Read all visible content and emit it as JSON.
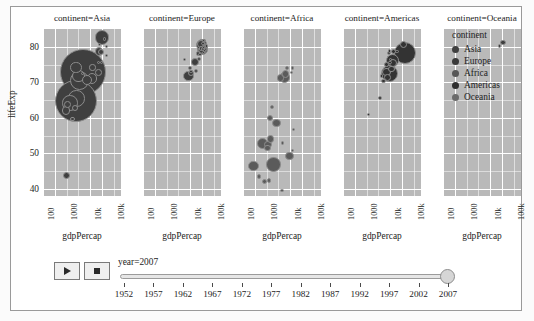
{
  "chart_data": {
    "type": "scatter",
    "title": "",
    "xlabel": "gdpPercap",
    "ylabel": "lifeExp",
    "xscale": "log",
    "xlim": [
      100,
      200000
    ],
    "ylim": [
      38,
      85
    ],
    "grid": true,
    "legend_position": "right",
    "legend_title": "continent",
    "size_by": "pop",
    "color_by": "continent",
    "animation_frame": "year",
    "current_frame": "year=2007",
    "xticks": [
      "100",
      "1000",
      "10k",
      "100k"
    ],
    "yticks": [
      "40",
      "50",
      "60",
      "70",
      "80"
    ],
    "facet_col": "continent",
    "facets": [
      {
        "title": "continent=Asia",
        "points": [
          {
            "country": "Japan",
            "gdpPercap": 31656,
            "lifeExp": 82.6,
            "pop": 127467972
          },
          {
            "country": "Hong Kong",
            "gdpPercap": 39725,
            "lifeExp": 82.2,
            "pop": 6980412
          },
          {
            "country": "Singapore",
            "gdpPercap": 47143,
            "lifeExp": 80.0,
            "pop": 4553009
          },
          {
            "country": "Israel",
            "gdpPercap": 25523,
            "lifeExp": 80.7,
            "pop": 6426679
          },
          {
            "country": "Korea Rep.",
            "gdpPercap": 23348,
            "lifeExp": 78.6,
            "pop": 49044790
          },
          {
            "country": "Kuwait",
            "gdpPercap": 47307,
            "lifeExp": 77.6,
            "pop": 2505559
          },
          {
            "country": "Taiwan",
            "gdpPercap": 28718,
            "lifeExp": 78.4,
            "pop": 23174294
          },
          {
            "country": "Bahrain",
            "gdpPercap": 29796,
            "lifeExp": 75.6,
            "pop": 708573
          },
          {
            "country": "Oman",
            "gdpPercap": 22316,
            "lifeExp": 75.6,
            "pop": 3204897
          },
          {
            "country": "Saudi Arabia",
            "gdpPercap": 21655,
            "lifeExp": 72.8,
            "pop": 27601038
          },
          {
            "country": "China",
            "gdpPercap": 4959,
            "lifeExp": 72.9,
            "pop": 1318683096
          },
          {
            "country": "Malaysia",
            "gdpPercap": 12451,
            "lifeExp": 74.2,
            "pop": 24821286
          },
          {
            "country": "Jordan",
            "gdpPercap": 4519,
            "lifeExp": 72.5,
            "pop": 6053193
          },
          {
            "country": "Iran",
            "gdpPercap": 11606,
            "lifeExp": 71.0,
            "pop": 69453570
          },
          {
            "country": "Thailand",
            "gdpPercap": 7458,
            "lifeExp": 70.6,
            "pop": 65068149
          },
          {
            "country": "Vietnam",
            "gdpPercap": 2441,
            "lifeExp": 74.2,
            "pop": 85262356
          },
          {
            "country": "Philippines",
            "gdpPercap": 3190,
            "lifeExp": 71.7,
            "pop": 91077287
          },
          {
            "country": "Indonesia",
            "gdpPercap": 3540,
            "lifeExp": 70.6,
            "pop": 223547000
          },
          {
            "country": "India",
            "gdpPercap": 2452,
            "lifeExp": 64.7,
            "pop": 1110396331
          },
          {
            "country": "Pakistan",
            "gdpPercap": 2605,
            "lifeExp": 65.5,
            "pop": 169270617
          },
          {
            "country": "Bangladesh",
            "gdpPercap": 1391,
            "lifeExp": 64.1,
            "pop": 150448339
          },
          {
            "country": "Myanmar",
            "gdpPercap": 944,
            "lifeExp": 62.1,
            "pop": 47761980
          },
          {
            "country": "Nepal",
            "gdpPercap": 1091,
            "lifeExp": 63.8,
            "pop": 28901790
          },
          {
            "country": "Cambodia",
            "gdpPercap": 1713,
            "lifeExp": 59.7,
            "pop": 14131858
          },
          {
            "country": "Yemen Rep.",
            "gdpPercap": 2280,
            "lifeExp": 62.7,
            "pop": 22211743
          },
          {
            "country": "Afghanistan",
            "gdpPercap": 975,
            "lifeExp": 43.8,
            "pop": 31889923
          }
        ]
      },
      {
        "title": "continent=Europe",
        "points": [
          {
            "country": "Norway",
            "gdpPercap": 49357,
            "lifeExp": 80.2,
            "pop": 4627926
          },
          {
            "country": "Switzerland",
            "gdpPercap": 37506,
            "lifeExp": 81.7,
            "pop": 7554661
          },
          {
            "country": "Iceland",
            "gdpPercap": 36181,
            "lifeExp": 81.8,
            "pop": 301931
          },
          {
            "country": "Ireland",
            "gdpPercap": 40676,
            "lifeExp": 78.9,
            "pop": 4109086
          },
          {
            "country": "Netherlands",
            "gdpPercap": 36798,
            "lifeExp": 79.8,
            "pop": 16570613
          },
          {
            "country": "Austria",
            "gdpPercap": 36126,
            "lifeExp": 79.8,
            "pop": 8199783
          },
          {
            "country": "Denmark",
            "gdpPercap": 35278,
            "lifeExp": 78.3,
            "pop": 5468120
          },
          {
            "country": "Sweden",
            "gdpPercap": 33860,
            "lifeExp": 80.9,
            "pop": 9031088
          },
          {
            "country": "Belgium",
            "gdpPercap": 33693,
            "lifeExp": 79.4,
            "pop": 10392226
          },
          {
            "country": "Germany",
            "gdpPercap": 32170,
            "lifeExp": 79.4,
            "pop": 82400996
          },
          {
            "country": "United Kingdom",
            "gdpPercap": 33203,
            "lifeExp": 79.4,
            "pop": 60776238
          },
          {
            "country": "France",
            "gdpPercap": 30470,
            "lifeExp": 80.7,
            "pop": 61083916
          },
          {
            "country": "Italy",
            "gdpPercap": 28569,
            "lifeExp": 80.5,
            "pop": 58147733
          },
          {
            "country": "Spain",
            "gdpPercap": 28821,
            "lifeExp": 80.9,
            "pop": 40448191
          },
          {
            "country": "Greece",
            "gdpPercap": 27538,
            "lifeExp": 79.5,
            "pop": 10706290
          },
          {
            "country": "Slovenia",
            "gdpPercap": 25768,
            "lifeExp": 77.9,
            "pop": 2009245
          },
          {
            "country": "Portugal",
            "gdpPercap": 20510,
            "lifeExp": 78.1,
            "pop": 10642836
          },
          {
            "country": "Czech Rep.",
            "gdpPercap": 22833,
            "lifeExp": 76.5,
            "pop": 10228744
          },
          {
            "country": "Poland",
            "gdpPercap": 15390,
            "lifeExp": 75.6,
            "pop": 38518241
          },
          {
            "country": "Hungary",
            "gdpPercap": 18009,
            "lifeExp": 73.3,
            "pop": 9956108
          },
          {
            "country": "Romania",
            "gdpPercap": 10808,
            "lifeExp": 72.5,
            "pop": 22276056
          },
          {
            "country": "Turkey",
            "gdpPercap": 8458,
            "lifeExp": 71.8,
            "pop": 71158647
          },
          {
            "country": "Bulgaria",
            "gdpPercap": 10681,
            "lifeExp": 73.0,
            "pop": 7322858
          },
          {
            "country": "Serbia",
            "gdpPercap": 9786,
            "lifeExp": 74.0,
            "pop": 10150265
          },
          {
            "country": "Albania",
            "gdpPercap": 5937,
            "lifeExp": 76.4,
            "pop": 3600523
          }
        ]
      },
      {
        "title": "continent=Africa",
        "points": [
          {
            "country": "Libya",
            "gdpPercap": 12057,
            "lifeExp": 74.0,
            "pop": 6036914
          },
          {
            "country": "Tunisia",
            "gdpPercap": 7093,
            "lifeExp": 73.9,
            "pop": 10276158
          },
          {
            "country": "Mauritius",
            "gdpPercap": 10957,
            "lifeExp": 72.8,
            "pop": 1250882
          },
          {
            "country": "Algeria",
            "gdpPercap": 6223,
            "lifeExp": 72.3,
            "pop": 33333216
          },
          {
            "country": "Egypt",
            "gdpPercap": 5581,
            "lifeExp": 71.3,
            "pop": 80264543
          },
          {
            "country": "Morocco",
            "gdpPercap": 3820,
            "lifeExp": 71.2,
            "pop": 33757175
          },
          {
            "country": "Gabon",
            "gdpPercap": 13206,
            "lifeExp": 56.7,
            "pop": 1454867
          },
          {
            "country": "Botswana",
            "gdpPercap": 12570,
            "lifeExp": 50.7,
            "pop": 1639131
          },
          {
            "country": "South Africa",
            "gdpPercap": 9270,
            "lifeExp": 49.3,
            "pop": 43997828
          },
          {
            "country": "Namibia",
            "gdpPercap": 4811,
            "lifeExp": 52.9,
            "pop": 2055080
          },
          {
            "country": "Sudan",
            "gdpPercap": 2602,
            "lifeExp": 58.6,
            "pop": 42292929
          },
          {
            "country": "Ghana",
            "gdpPercap": 1328,
            "lifeExp": 60.0,
            "pop": 22873338
          },
          {
            "country": "Senegal",
            "gdpPercap": 1712,
            "lifeExp": 63.1,
            "pop": 12267493
          },
          {
            "country": "Kenya",
            "gdpPercap": 1463,
            "lifeExp": 54.1,
            "pop": 35610177
          },
          {
            "country": "Nigeria",
            "gdpPercap": 2014,
            "lifeExp": 46.9,
            "pop": 135031164
          },
          {
            "country": "Ethiopia",
            "gdpPercap": 691,
            "lifeExp": 52.9,
            "pop": 76511887
          },
          {
            "country": "Congo Dem. Rep.",
            "gdpPercap": 278,
            "lifeExp": 46.5,
            "pop": 64606759
          },
          {
            "country": "Tanzania",
            "gdpPercap": 1107,
            "lifeExp": 52.5,
            "pop": 38139640
          },
          {
            "country": "Uganda",
            "gdpPercap": 1056,
            "lifeExp": 51.5,
            "pop": 29170398
          },
          {
            "country": "Mozambique",
            "gdpPercap": 823,
            "lifeExp": 42.1,
            "pop": 19951656
          },
          {
            "country": "Zimbabwe",
            "gdpPercap": 470,
            "lifeExp": 43.5,
            "pop": 12311143
          },
          {
            "country": "Zambia",
            "gdpPercap": 1271,
            "lifeExp": 42.4,
            "pop": 11746035
          },
          {
            "country": "Swaziland",
            "gdpPercap": 4513,
            "lifeExp": 39.6,
            "pop": 1133066
          }
        ]
      },
      {
        "title": "continent=Americas",
        "points": [
          {
            "country": "United States",
            "gdpPercap": 42952,
            "lifeExp": 78.2,
            "pop": 301139947
          },
          {
            "country": "Canada",
            "gdpPercap": 36319,
            "lifeExp": 80.7,
            "pop": 33390141
          },
          {
            "country": "Puerto Rico",
            "gdpPercap": 19329,
            "lifeExp": 78.7,
            "pop": 3942491
          },
          {
            "country": "Chile",
            "gdpPercap": 13172,
            "lifeExp": 78.6,
            "pop": 16284741
          },
          {
            "country": "Costa Rica",
            "gdpPercap": 9645,
            "lifeExp": 78.8,
            "pop": 4133884
          },
          {
            "country": "Cuba",
            "gdpPercap": 8948,
            "lifeExp": 78.3,
            "pop": 11416987
          },
          {
            "country": "Mexico",
            "gdpPercap": 11978,
            "lifeExp": 76.2,
            "pop": 108700891
          },
          {
            "country": "Argentina",
            "gdpPercap": 12779,
            "lifeExp": 75.3,
            "pop": 40301927
          },
          {
            "country": "Uruguay",
            "gdpPercap": 10611,
            "lifeExp": 76.4,
            "pop": 3447496
          },
          {
            "country": "Panama",
            "gdpPercap": 9809,
            "lifeExp": 75.5,
            "pop": 3242173
          },
          {
            "country": "Venezuela",
            "gdpPercap": 11416,
            "lifeExp": 73.7,
            "pop": 26084662
          },
          {
            "country": "Brazil",
            "gdpPercap": 9066,
            "lifeExp": 72.4,
            "pop": 190010647
          },
          {
            "country": "Colombia",
            "gdpPercap": 7007,
            "lifeExp": 72.9,
            "pop": 44227550
          },
          {
            "country": "Peru",
            "gdpPercap": 7409,
            "lifeExp": 71.4,
            "pop": 28674757
          },
          {
            "country": "Ecuador",
            "gdpPercap": 6873,
            "lifeExp": 75.0,
            "pop": 13755680
          },
          {
            "country": "Paraguay",
            "gdpPercap": 4173,
            "lifeExp": 71.8,
            "pop": 6667147
          },
          {
            "country": "Guatemala",
            "gdpPercap": 5186,
            "lifeExp": 70.3,
            "pop": 12572928
          },
          {
            "country": "Bolivia",
            "gdpPercap": 3822,
            "lifeExp": 65.6,
            "pop": 9119152
          },
          {
            "country": "Haiti",
            "gdpPercap": 1201,
            "lifeExp": 60.9,
            "pop": 8502814
          }
        ]
      },
      {
        "title": "continent=Oceania",
        "points": [
          {
            "country": "Australia",
            "gdpPercap": 34435,
            "lifeExp": 81.2,
            "pop": 20434176
          },
          {
            "country": "New Zealand",
            "gdpPercap": 25185,
            "lifeExp": 80.2,
            "pop": 4115771
          }
        ]
      }
    ],
    "legend": [
      {
        "label": "Asia",
        "color": "#3f3f3f"
      },
      {
        "label": "Europe",
        "color": "#3a3a3a"
      },
      {
        "label": "Africa",
        "color": "#575757"
      },
      {
        "label": "Americas",
        "color": "#2e2e2e"
      },
      {
        "label": "Oceania",
        "color": "#6a6a6a"
      }
    ]
  },
  "axes": {
    "y_title": "lifeExp",
    "y_ticks": [
      "80",
      "70",
      "60",
      "50",
      "40"
    ],
    "x_title": "gdpPercap",
    "x_ticks": [
      "100",
      "1000",
      "10k",
      "100k"
    ]
  },
  "legend": {
    "title": "continent",
    "items": [
      {
        "label": "Asia"
      },
      {
        "label": "Europe"
      },
      {
        "label": "Africa"
      },
      {
        "label": "Americas"
      },
      {
        "label": "Oceania"
      }
    ]
  },
  "controls": {
    "play_label": "play-triangle",
    "pause_label": "stop-square",
    "slider_label": "year=2007",
    "slider_value": "2007",
    "ticks": [
      "1952",
      "1957",
      "1962",
      "1967",
      "1972",
      "1977",
      "1982",
      "1987",
      "1992",
      "1997",
      "2002",
      "2007"
    ]
  },
  "facet_titles": [
    "continent=Asia",
    "continent=Europe",
    "continent=Africa",
    "continent=Americas",
    "continent=Oceania"
  ]
}
